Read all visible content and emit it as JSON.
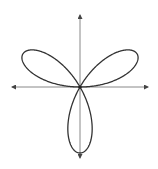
{
  "diagram": {
    "type": "polar-rose-curve",
    "equation": "r = sin(3θ)",
    "petals": 3,
    "petal_directions_deg": [
      30,
      150,
      270
    ],
    "center": {
      "x": 80,
      "y": 87
    },
    "petal_length_px": 66,
    "axes": {
      "x_axis": {
        "y": 87,
        "x_start": 12,
        "x_end": 148,
        "arrows": "both"
      },
      "y_axis": {
        "x": 80,
        "y_start": 15,
        "y_end": 158,
        "arrows": "both"
      }
    },
    "colors": {
      "curve": "#333333",
      "axes": "#888888",
      "background": "#ffffff"
    }
  }
}
